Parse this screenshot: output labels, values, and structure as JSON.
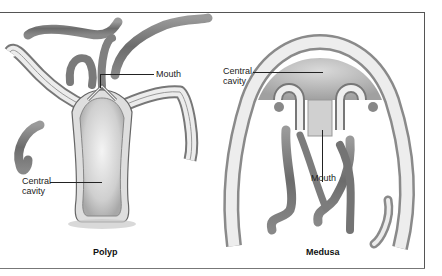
{
  "figure": {
    "panels": [
      {
        "name": "polyp",
        "caption": "Polyp",
        "labels": {
          "mouth": "Mouth",
          "cavity_line1": "Central",
          "cavity_line2": "cavity"
        }
      },
      {
        "name": "medusa",
        "caption": "Medusa",
        "labels": {
          "mouth": "Mouth",
          "cavity_line1": "Central",
          "cavity_line2": "cavity"
        }
      }
    ],
    "colors": {
      "body_wall": "#e9e9e9",
      "tissue_dark": "#6e6e6e",
      "shadow": "#9a9a9a",
      "frame": "#555555"
    }
  }
}
